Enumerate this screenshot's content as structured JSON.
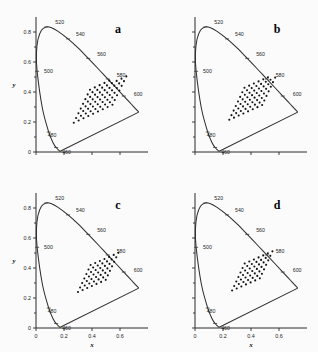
{
  "figure": {
    "panel_count": 4,
    "background_color": "#fbfbfb",
    "line_color": "#2e2e2e",
    "point_color": "#141414"
  },
  "axes": {
    "x_label": "x",
    "y_label": "y",
    "x_ticks": [
      "0",
      "0.2",
      "0.4",
      "0.6"
    ],
    "x_tick_values": [
      0,
      0.2,
      0.4,
      0.6
    ],
    "y_ticks": [
      "0",
      "0.2",
      "0.4",
      "0.6",
      "0.8"
    ],
    "y_tick_values": [
      0,
      0.2,
      0.4,
      0.6,
      0.8
    ],
    "xlim": [
      0,
      0.8
    ],
    "ylim": [
      0,
      0.9
    ]
  },
  "wavelength_labels": [
    "460",
    "480",
    "500",
    "520",
    "540",
    "560",
    "580",
    "600"
  ],
  "panels": [
    {
      "letter": "a",
      "position": "top-left",
      "show_y_ticks": true,
      "show_x_ticks": false,
      "show_y_title": true,
      "show_x_title": false
    },
    {
      "letter": "b",
      "position": "top-right",
      "show_y_ticks": false,
      "show_x_ticks": false,
      "show_y_title": false,
      "show_x_title": false
    },
    {
      "letter": "c",
      "position": "bottom-left",
      "show_y_ticks": true,
      "show_x_ticks": true,
      "show_y_title": true,
      "show_x_title": true
    },
    {
      "letter": "d",
      "position": "bottom-right",
      "show_y_ticks": false,
      "show_x_ticks": true,
      "show_y_title": false,
      "show_x_title": true
    }
  ],
  "chart_data": {
    "type": "scatter",
    "xlabel": "x",
    "ylabel": "y",
    "xlim": [
      0,
      0.8
    ],
    "ylim": [
      0,
      0.9
    ],
    "grid": false,
    "legend": "none",
    "spectral_locus_wavelength_markers": [
      {
        "nm": 460,
        "x": 0.144,
        "y": 0.03
      },
      {
        "nm": 480,
        "x": 0.091,
        "y": 0.133
      },
      {
        "nm": 500,
        "x": 0.008,
        "y": 0.538
      },
      {
        "nm": 520,
        "x": 0.074,
        "y": 0.834
      },
      {
        "nm": 540,
        "x": 0.229,
        "y": 0.754
      },
      {
        "nm": 560,
        "x": 0.373,
        "y": 0.624
      },
      {
        "nm": 580,
        "x": 0.512,
        "y": 0.487
      },
      {
        "nm": 600,
        "x": 0.627,
        "y": 0.373
      }
    ],
    "spectral_locus": [
      {
        "nm": 400,
        "x": 0.173,
        "y": 0.005
      },
      {
        "nm": 420,
        "x": 0.171,
        "y": 0.005
      },
      {
        "nm": 440,
        "x": 0.16,
        "y": 0.014
      },
      {
        "nm": 460,
        "x": 0.144,
        "y": 0.03
      },
      {
        "nm": 470,
        "x": 0.124,
        "y": 0.058
      },
      {
        "nm": 480,
        "x": 0.091,
        "y": 0.133
      },
      {
        "nm": 490,
        "x": 0.045,
        "y": 0.295
      },
      {
        "nm": 500,
        "x": 0.008,
        "y": 0.538
      },
      {
        "nm": 505,
        "x": 0.003,
        "y": 0.655
      },
      {
        "nm": 510,
        "x": 0.014,
        "y": 0.75
      },
      {
        "nm": 515,
        "x": 0.039,
        "y": 0.812
      },
      {
        "nm": 520,
        "x": 0.074,
        "y": 0.834
      },
      {
        "nm": 525,
        "x": 0.115,
        "y": 0.827
      },
      {
        "nm": 530,
        "x": 0.155,
        "y": 0.806
      },
      {
        "nm": 540,
        "x": 0.229,
        "y": 0.754
      },
      {
        "nm": 550,
        "x": 0.302,
        "y": 0.692
      },
      {
        "nm": 560,
        "x": 0.373,
        "y": 0.624
      },
      {
        "nm": 570,
        "x": 0.444,
        "y": 0.555
      },
      {
        "nm": 580,
        "x": 0.512,
        "y": 0.487
      },
      {
        "nm": 590,
        "x": 0.575,
        "y": 0.425
      },
      {
        "nm": 600,
        "x": 0.627,
        "y": 0.373
      },
      {
        "nm": 610,
        "x": 0.666,
        "y": 0.334
      },
      {
        "nm": 620,
        "x": 0.692,
        "y": 0.308
      },
      {
        "nm": 640,
        "x": 0.719,
        "y": 0.281
      },
      {
        "nm": 660,
        "x": 0.73,
        "y": 0.27
      },
      {
        "nm": 700,
        "x": 0.734,
        "y": 0.266
      }
    ],
    "series": [
      {
        "name": "panel a lattice",
        "panel": "a",
        "n_points": 68,
        "lattice": {
          "cols": 9,
          "rows": 8,
          "origin": [
            0.27,
            0.195
          ],
          "col_step": [
            0.0345,
            0.015
          ],
          "row_step": [
            0.0165,
            0.0315
          ]
        },
        "x_range": [
          0.27,
          0.6
        ],
        "y_range": [
          0.195,
          0.56
        ]
      },
      {
        "name": "panel b lattice",
        "panel": "b",
        "n_points": 62,
        "lattice": {
          "cols": 8,
          "rows": 8,
          "origin": [
            0.245,
            0.215
          ],
          "col_step": [
            0.0335,
            0.014
          ],
          "row_step": [
            0.0155,
            0.0305
          ]
        },
        "x_range": [
          0.245,
          0.53
        ],
        "y_range": [
          0.215,
          0.56
        ]
      },
      {
        "name": "panel c lattice",
        "panel": "c",
        "n_points": 49,
        "lattice": {
          "cols": 7,
          "rows": 7,
          "origin": [
            0.3,
            0.24
          ],
          "col_step": [
            0.033,
            0.0135
          ],
          "row_step": [
            0.015,
            0.03
          ]
        },
        "x_range": [
          0.3,
          0.55
        ],
        "y_range": [
          0.24,
          0.53
        ]
      },
      {
        "name": "panel d lattice",
        "panel": "d",
        "n_points": 49,
        "lattice": {
          "cols": 7,
          "rows": 7,
          "origin": [
            0.265,
            0.25
          ],
          "col_step": [
            0.033,
            0.0135
          ],
          "row_step": [
            0.015,
            0.03
          ]
        },
        "x_range": [
          0.265,
          0.52
        ],
        "y_range": [
          0.25,
          0.54
        ]
      }
    ]
  }
}
